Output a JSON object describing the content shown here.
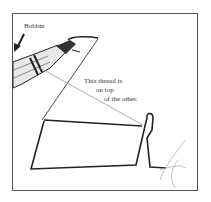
{
  "figure": {
    "labels": {
      "bobbin": "Bobbin",
      "thread_line1": "This thread is",
      "thread_line2": "on top",
      "thread_line3": "of the other."
    },
    "colors": {
      "ink": "#222222",
      "thread_light": "#999999",
      "border": "#555555"
    }
  }
}
